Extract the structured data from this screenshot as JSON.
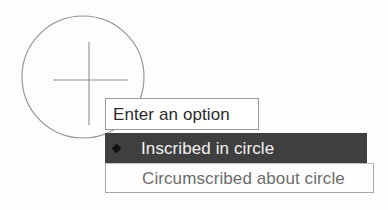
{
  "app": {
    "background_color": "#fdfdfd"
  },
  "drawing": {
    "name": "circle-with-crosshair-preview",
    "stroke_color": "#8a8a8a",
    "circle": {
      "center_x": 83,
      "center_y": 77,
      "radius": 61
    },
    "crosshair": {
      "center_x": 89,
      "center_y": 80,
      "vertical_top": 42,
      "vertical_bottom": 125,
      "horizontal_left": 53,
      "horizontal_right": 128
    }
  },
  "prompt": {
    "label": "Enter an option",
    "placeholder": "Enter an option",
    "border_color": "#9a9a9a",
    "text_color": "#2b2b2b",
    "background_color": "#ffffff"
  },
  "options": {
    "selected_index": 0,
    "highlight_color": "#3f3f3f",
    "highlight_text_color": "#f2f2f2",
    "normal_text_color": "#6c6c6c",
    "bullet_icon": "diamond-bullet-icon",
    "items": [
      {
        "label": "Inscribed in circle",
        "selected": true
      },
      {
        "label": "Circumscribed about circle",
        "selected": false
      }
    ]
  }
}
